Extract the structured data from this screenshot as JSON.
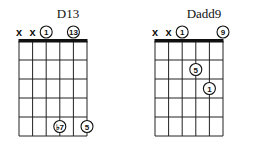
{
  "chords": [
    {
      "name": "D13",
      "strings": 6,
      "frets": 5,
      "open_marks": [
        {
          "string": 1,
          "type": "x",
          "label": "x"
        },
        {
          "string": 2,
          "type": "x",
          "label": "x"
        },
        {
          "string": 3,
          "type": "circle",
          "label": "1"
        },
        {
          "string": 5,
          "type": "circle",
          "label": "13"
        }
      ],
      "fretted": [
        {
          "string": 4,
          "fret": 5,
          "label": "♭7"
        },
        {
          "string": 6,
          "fret": 5,
          "label": "5"
        }
      ]
    },
    {
      "name": "Dadd9",
      "strings": 6,
      "frets": 5,
      "open_marks": [
        {
          "string": 1,
          "type": "x",
          "label": "x"
        },
        {
          "string": 2,
          "type": "x",
          "label": "x"
        },
        {
          "string": 3,
          "type": "circle",
          "label": "1"
        },
        {
          "string": 6,
          "type": "circle",
          "label": "9"
        }
      ],
      "fretted": [
        {
          "string": 4,
          "fret": 2,
          "label": "5"
        },
        {
          "string": 5,
          "fret": 3,
          "label": "1"
        }
      ]
    }
  ]
}
